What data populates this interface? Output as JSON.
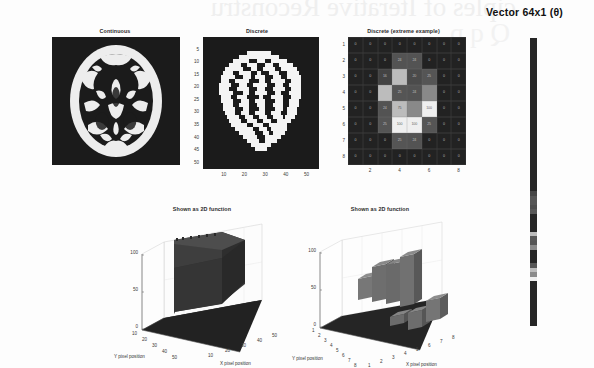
{
  "figure": {
    "watermark_text": "ciples of Iterative Reconstru",
    "watermark_text2": "Q q p",
    "background_color": "#fdfdfd"
  },
  "panels": {
    "continuous": {
      "title": "Continuous",
      "image_color_dark": "#1b1b1b",
      "image_color_light": "#f2f2f2"
    },
    "discrete": {
      "title": "Discrete",
      "y_ticks": [
        "5",
        "10",
        "15",
        "20",
        "25",
        "30",
        "35",
        "40",
        "45",
        "50"
      ],
      "x_ticks": [
        "10",
        "20",
        "30",
        "40",
        "50"
      ]
    },
    "discrete_extreme": {
      "title": "Discrete (extreme example)",
      "y_ticks": [
        "1",
        "2",
        "3",
        "4",
        "5",
        "6",
        "7",
        "8"
      ],
      "x_ticks": [
        "2",
        "4",
        "6",
        "8"
      ]
    },
    "surface_continuous": {
      "title": "Shown as 2D function",
      "z_ticks": [
        "100",
        "50",
        "0"
      ],
      "y_ticks": [
        "10",
        "20",
        "30",
        "40",
        "50"
      ],
      "x_ticks": [
        "10",
        "20",
        "30",
        "40",
        "50"
      ],
      "y_axis_label": "Y pixel position",
      "x_axis_label": "X pixel position"
    },
    "surface_discrete": {
      "title": "Shown as 2D function",
      "z_ticks": [
        "100",
        "50",
        "0"
      ],
      "y_ticks": [
        "1",
        "2",
        "3",
        "4",
        "5",
        "6",
        "7",
        "8"
      ],
      "x_ticks": [
        "1",
        "2",
        "3",
        "4",
        "5",
        "6",
        "7",
        "8"
      ],
      "y_axis_label": "Y pixel position",
      "x_axis_label": "X pixel position"
    },
    "vector": {
      "title": "Vector 64x1 (θ)"
    }
  },
  "chart_data": {
    "type": "heatmap",
    "title": "Discrete (extreme example)",
    "xlabel": "",
    "ylabel": "",
    "x": [
      1,
      2,
      3,
      4,
      5,
      6,
      7,
      8
    ],
    "y": [
      1,
      2,
      3,
      4,
      5,
      6,
      7,
      8
    ],
    "zlim": [
      0,
      100
    ],
    "grid": true,
    "values": [
      [
        0,
        0,
        0,
        0,
        0,
        0,
        0,
        0
      ],
      [
        0,
        0,
        0,
        24,
        24,
        0,
        0,
        0
      ],
      [
        0,
        0,
        16,
        75,
        20,
        25,
        0,
        0
      ],
      [
        0,
        0,
        75,
        25,
        24,
        50,
        0,
        0
      ],
      [
        0,
        0,
        24,
        75,
        50,
        100,
        0,
        0
      ],
      [
        0,
        0,
        25,
        100,
        100,
        25,
        0,
        0
      ],
      [
        0,
        0,
        0,
        25,
        24,
        0,
        0,
        0
      ],
      [
        0,
        0,
        0,
        0,
        0,
        0,
        0,
        0
      ]
    ],
    "cell_labels": [
      [
        "0",
        "0",
        "0",
        "0",
        "0",
        "0",
        "0",
        "0"
      ],
      [
        "0",
        "0",
        "0",
        "24",
        "24",
        "0",
        "0",
        "0"
      ],
      [
        "0",
        "0",
        "16",
        "",
        "20",
        "25",
        "0",
        "0"
      ],
      [
        "0",
        "0",
        "",
        "25",
        "24",
        "",
        "0",
        "0"
      ],
      [
        "0",
        "0",
        "24",
        "75",
        "",
        "100",
        "0",
        "0"
      ],
      [
        "0",
        "0",
        "25",
        "100",
        "100",
        "25",
        "0",
        "0"
      ],
      [
        "0",
        "0",
        "0",
        "25",
        "24",
        "0",
        "0",
        "0"
      ],
      [
        "0",
        "0",
        "0",
        "0",
        "0",
        "0",
        "0",
        "0"
      ]
    ],
    "series": [
      {
        "name": "surface_discrete_bars",
        "values": [
          [
            0,
            0,
            0,
            0,
            0,
            0,
            0,
            0
          ],
          [
            0,
            0,
            0,
            24,
            24,
            0,
            0,
            0
          ],
          [
            0,
            0,
            16,
            75,
            20,
            25,
            0,
            0
          ],
          [
            0,
            0,
            75,
            25,
            24,
            50,
            0,
            0
          ],
          [
            0,
            0,
            24,
            75,
            50,
            100,
            0,
            0
          ],
          [
            0,
            0,
            25,
            100,
            100,
            25,
            0,
            0
          ],
          [
            0,
            0,
            0,
            25,
            24,
            0,
            0,
            0
          ],
          [
            0,
            0,
            0,
            0,
            0,
            0,
            0,
            0
          ]
        ]
      }
    ],
    "vector_values": [
      0,
      0,
      0,
      0,
      0,
      0,
      0,
      0,
      0,
      0,
      0,
      0,
      0,
      0,
      0,
      0,
      0,
      0,
      0,
      0,
      0,
      0,
      0,
      0,
      0,
      0,
      0,
      0,
      0,
      0,
      0,
      0,
      0,
      0,
      16,
      24,
      24,
      20,
      25,
      0,
      0,
      0,
      0,
      75,
      25,
      24,
      50,
      0,
      0,
      0,
      24,
      75,
      50,
      100,
      0,
      0,
      0,
      0,
      0,
      0,
      0,
      0,
      0,
      0
    ]
  }
}
